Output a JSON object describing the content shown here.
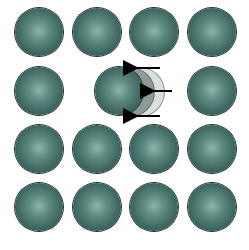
{
  "diagram": {
    "colors": {
      "sphere": "#3c6660",
      "highlight": "#8fb3aa",
      "arrow": "#000000"
    },
    "spheres": [
      {
        "cx": 39,
        "cy": 32
      },
      {
        "cx": 97,
        "cy": 32
      },
      {
        "cx": 154,
        "cy": 32
      },
      {
        "cx": 212,
        "cy": 32
      },
      {
        "cx": 39,
        "cy": 91
      },
      {
        "cx": 212,
        "cy": 91
      },
      {
        "cx": 39,
        "cy": 149
      },
      {
        "cx": 97,
        "cy": 149
      },
      {
        "cx": 154,
        "cy": 149
      },
      {
        "cx": 212,
        "cy": 149
      },
      {
        "cx": 39,
        "cy": 207
      },
      {
        "cx": 97,
        "cy": 207
      },
      {
        "cx": 154,
        "cy": 207
      },
      {
        "cx": 212,
        "cy": 207
      }
    ],
    "moving_sphere": {
      "cx": 119,
      "cy": 91,
      "ghost_offsets": [
        10,
        20
      ]
    },
    "arrows": [
      {
        "x1": 160,
        "y1": 68,
        "x2": 135,
        "y2": 68
      },
      {
        "x1": 172,
        "y1": 91,
        "x2": 152,
        "y2": 91
      },
      {
        "x1": 160,
        "y1": 116,
        "x2": 135,
        "y2": 116
      }
    ]
  }
}
